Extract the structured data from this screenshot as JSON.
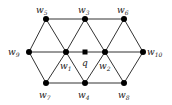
{
  "diagram": {
    "type": "graph",
    "nodes": [
      {
        "id": "w5",
        "label": "w",
        "sub": "5",
        "x": 46,
        "y": 19,
        "lx": 36,
        "ly": 13,
        "shape": "circle"
      },
      {
        "id": "w3",
        "label": "w",
        "sub": "3",
        "x": 85,
        "y": 19,
        "lx": 78,
        "ly": 13,
        "shape": "circle"
      },
      {
        "id": "w6",
        "label": "w",
        "sub": "6",
        "x": 124,
        "y": 19,
        "lx": 117,
        "ly": 13,
        "shape": "circle"
      },
      {
        "id": "w9",
        "label": "w",
        "sub": "9",
        "x": 29,
        "y": 52,
        "lx": 8,
        "ly": 55,
        "shape": "circle"
      },
      {
        "id": "w1",
        "label": "w",
        "sub": "1",
        "x": 66,
        "y": 52,
        "lx": 60,
        "ly": 69,
        "shape": "circle"
      },
      {
        "id": "q",
        "label": "q",
        "sub": "",
        "x": 85,
        "y": 52,
        "lx": 82,
        "ly": 66,
        "shape": "square"
      },
      {
        "id": "w2",
        "label": "w",
        "sub": "2",
        "x": 105,
        "y": 52,
        "lx": 99,
        "ly": 69,
        "shape": "circle"
      },
      {
        "id": "w10",
        "label": "w",
        "sub": "10",
        "x": 143,
        "y": 52,
        "lx": 147,
        "ly": 55,
        "shape": "circle"
      },
      {
        "id": "w7",
        "label": "w",
        "sub": "7",
        "x": 46,
        "y": 83,
        "lx": 39,
        "ly": 98,
        "shape": "circle"
      },
      {
        "id": "w4",
        "label": "w",
        "sub": "4",
        "x": 85,
        "y": 83,
        "lx": 78,
        "ly": 98,
        "shape": "circle"
      },
      {
        "id": "w8",
        "label": "w",
        "sub": "8",
        "x": 124,
        "y": 83,
        "lx": 118,
        "ly": 98,
        "shape": "circle"
      }
    ],
    "edges": [
      [
        "w5",
        "w3"
      ],
      [
        "w3",
        "w6"
      ],
      [
        "w9",
        "w1"
      ],
      [
        "w1",
        "q"
      ],
      [
        "q",
        "w2"
      ],
      [
        "w2",
        "w10"
      ],
      [
        "w7",
        "w4"
      ],
      [
        "w4",
        "w8"
      ],
      [
        "w9",
        "w5"
      ],
      [
        "w9",
        "w7"
      ],
      [
        "w5",
        "w1"
      ],
      [
        "w1",
        "w3"
      ],
      [
        "w3",
        "w2"
      ],
      [
        "w2",
        "w6"
      ],
      [
        "w6",
        "w10"
      ],
      [
        "w10",
        "w8"
      ],
      [
        "w1",
        "w7"
      ],
      [
        "w1",
        "w4"
      ],
      [
        "w4",
        "w2"
      ],
      [
        "w2",
        "w8"
      ]
    ]
  }
}
